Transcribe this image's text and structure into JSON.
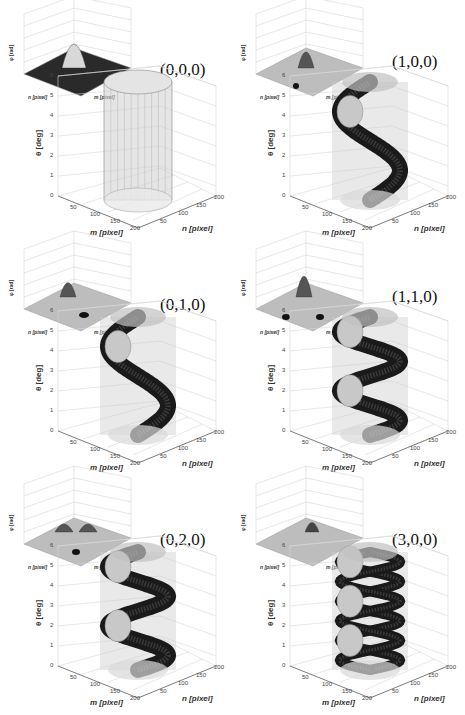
{
  "figure": {
    "panels": [
      {
        "id": "p000",
        "mode": "(0,0,0)",
        "shape": "cylinder",
        "inset": "gaussian-peak",
        "helix_turns": 0
      },
      {
        "id": "p100",
        "mode": "(1,0,0)",
        "shape": "double-helix",
        "inset": "peak-with-dip",
        "helix_turns": 1
      },
      {
        "id": "p010",
        "mode": "(0,1,0)",
        "shape": "double-helix",
        "inset": "peak-and-trough",
        "helix_turns": 1
      },
      {
        "id": "p110",
        "mode": "(1,1,0)",
        "shape": "double-helix",
        "inset": "peak-two-troughs",
        "helix_turns": 2
      },
      {
        "id": "p020",
        "mode": "(0,2,0)",
        "shape": "double-helix",
        "inset": "two-peaks-trough",
        "helix_turns": 2
      },
      {
        "id": "p300",
        "mode": "(3,0,0)",
        "shape": "multi-helix",
        "inset": "small-peak",
        "helix_turns": 3
      }
    ],
    "axes": {
      "theta_label": "θ [deg]",
      "m_label": "m [pixel]",
      "n_label": "n [pixel]",
      "theta_ticks": [
        "0",
        "1",
        "2",
        "3",
        "4",
        "5",
        "6"
      ],
      "m_ticks": [
        "50",
        "100",
        "150",
        "200"
      ],
      "n_ticks": [
        "50",
        "100",
        "150",
        "200"
      ],
      "inset_x_label": "n [pixel]",
      "inset_y_label": "m [pixel]",
      "inset_z_label": "φ [rad]"
    }
  }
}
